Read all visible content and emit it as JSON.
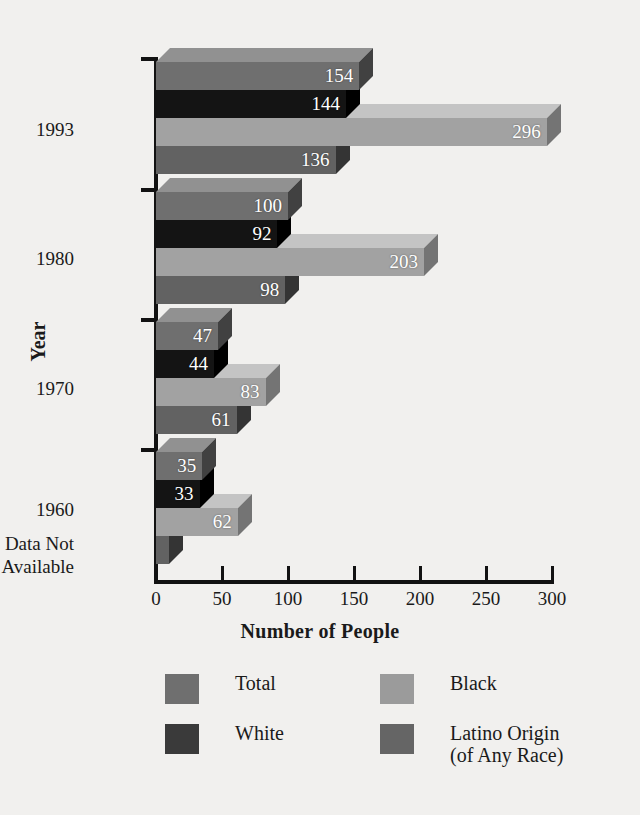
{
  "chart_data": {
    "type": "bar",
    "orientation": "horizontal",
    "title": "",
    "xlabel": "Number of People",
    "ylabel": "Year",
    "xlim": [
      0,
      310
    ],
    "xticks": [
      0,
      50,
      100,
      150,
      200,
      250,
      300
    ],
    "grid": false,
    "legend_position": "bottom",
    "categories": [
      "1993",
      "1980",
      "1970",
      "1960"
    ],
    "category_extra_label": "Data Not Available",
    "series": [
      {
        "name": "Total",
        "color": "#6f6f6f",
        "values": [
          154,
          100,
          47,
          35
        ]
      },
      {
        "name": "White",
        "color": "#2b2b2b",
        "values": [
          144,
          92,
          44,
          33
        ]
      },
      {
        "name": "Black",
        "color": "#a2a2a2",
        "values": [
          296,
          203,
          83,
          62
        ]
      },
      {
        "name": "Latino Origin (of Any Race)",
        "color": "#626262",
        "values": [
          136,
          98,
          61,
          null
        ]
      }
    ],
    "note": "1960 Latino Origin value is not plotted - Data Not Available"
  },
  "axis": {
    "x_title": "Number of People",
    "y_title": "Year",
    "x_tick_labels": [
      "0",
      "50",
      "100",
      "150",
      "200",
      "250",
      "300"
    ],
    "y_tick_labels": [
      "1993",
      "1980",
      "1970",
      "1960"
    ],
    "y_footnote_line1": "Data Not",
    "y_footnote_line2": "Available"
  },
  "bars": [
    {
      "group": "1993",
      "series": "Total",
      "value": 154,
      "label": "154",
      "color": "#6f6f6f"
    },
    {
      "group": "1993",
      "series": "White",
      "value": 144,
      "label": "144",
      "color": "#141414"
    },
    {
      "group": "1993",
      "series": "Black",
      "value": 296,
      "label": "296",
      "color": "#a2a2a2"
    },
    {
      "group": "1993",
      "series": "Latino",
      "value": 136,
      "label": "136",
      "color": "#626262"
    },
    {
      "group": "1980",
      "series": "Total",
      "value": 100,
      "label": "100",
      "color": "#6f6f6f"
    },
    {
      "group": "1980",
      "series": "White",
      "value": 92,
      "label": "92",
      "color": "#141414"
    },
    {
      "group": "1980",
      "series": "Black",
      "value": 203,
      "label": "203",
      "color": "#a2a2a2"
    },
    {
      "group": "1980",
      "series": "Latino",
      "value": 98,
      "label": "98",
      "color": "#626262"
    },
    {
      "group": "1970",
      "series": "Total",
      "value": 47,
      "label": "47",
      "color": "#6f6f6f"
    },
    {
      "group": "1970",
      "series": "White",
      "value": 44,
      "label": "44",
      "color": "#141414"
    },
    {
      "group": "1970",
      "series": "Black",
      "value": 83,
      "label": "83",
      "color": "#a2a2a2"
    },
    {
      "group": "1970",
      "series": "Latino",
      "value": 61,
      "label": "61",
      "color": "#626262"
    },
    {
      "group": "1960",
      "series": "Total",
      "value": 35,
      "label": "35",
      "color": "#6f6f6f"
    },
    {
      "group": "1960",
      "series": "White",
      "value": 33,
      "label": "33",
      "color": "#141414"
    },
    {
      "group": "1960",
      "series": "Black",
      "value": 62,
      "label": "62",
      "color": "#a2a2a2"
    },
    {
      "group": "1960",
      "series": "Latino",
      "value": 10,
      "label": "",
      "color": "#626262"
    }
  ],
  "legend": {
    "items": [
      {
        "key": "total",
        "label": "Total",
        "color": "#6f6f6f"
      },
      {
        "key": "black",
        "label": "Black",
        "color": "#9b9b9b"
      },
      {
        "key": "white",
        "label": "White",
        "color": "#3a3a3a"
      },
      {
        "key": "latino",
        "label": "Latino Origin\n(of Any Race)",
        "color": "#656565"
      }
    ]
  },
  "colors": {
    "background": "#f1f0ee",
    "axis": "#121212",
    "value_text": "#ffffff",
    "text": "#1a1a1a"
  }
}
